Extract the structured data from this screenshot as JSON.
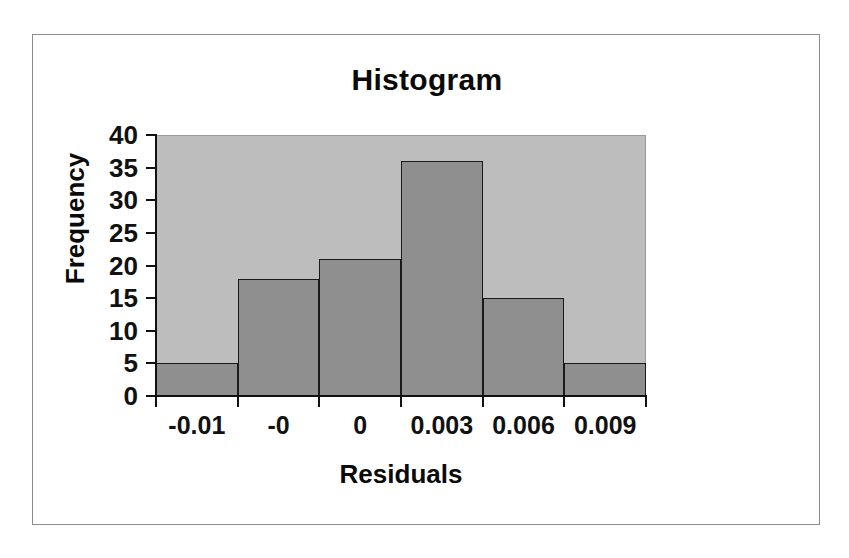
{
  "chart_data": {
    "type": "bar",
    "title": "Histogram",
    "xlabel": "Residuals",
    "ylabel": "Frequency",
    "categories": [
      "-0.01",
      "-0",
      "0",
      "0.003",
      "0.006",
      "0.009"
    ],
    "values": [
      5,
      18,
      21,
      36,
      15,
      5
    ],
    "ylim": [
      0,
      40
    ],
    "yticks": [
      0,
      5,
      10,
      15,
      20,
      25,
      30,
      35,
      40
    ],
    "ytick_labels": [
      "0",
      "5",
      "10",
      "15",
      "20",
      "25",
      "30",
      "35",
      "40"
    ],
    "grid": false,
    "legend": false,
    "colors": {
      "bar_fill": "#8f8f8f",
      "bar_border": "#1a1a1a",
      "plot_background": "#bdbdbd",
      "figure_background": "#ffffff",
      "axis": "#111111",
      "text": "#0a0a0a",
      "frame_border": "#8c8c8c"
    }
  }
}
